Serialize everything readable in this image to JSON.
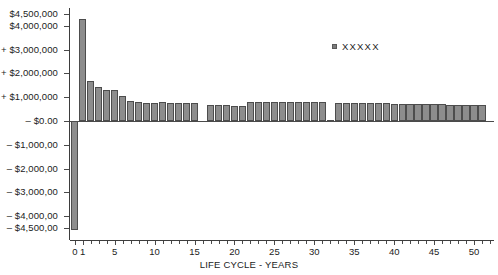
{
  "chart_data": {
    "type": "bar",
    "title": "",
    "subtitle": "",
    "xlabel": "LIFE CYCLE - YEARS",
    "ylabel": "",
    "grid": false,
    "legend_position": "inside-top-right",
    "legend": [
      {
        "label": "XXXXX",
        "color": "#8d8d8d"
      }
    ],
    "ylim": [
      -5000000,
      4750000
    ],
    "xlim": [
      -0.6,
      52.5
    ],
    "y_ticks": [
      {
        "value": 4500000,
        "label": "$4,500,000"
      },
      {
        "value": 4000000,
        "label": "$4,000,000"
      },
      {
        "value": 3000000,
        "label": "+ $3,000,000"
      },
      {
        "value": 2000000,
        "label": "+ $2,000,000"
      },
      {
        "value": 1000000,
        "label": "+ $1,000,000"
      },
      {
        "value": 0,
        "label": "– $0.00"
      },
      {
        "value": -1000000,
        "label": "– $1,000,00"
      },
      {
        "value": -2000000,
        "label": "– $2,000,00"
      },
      {
        "value": -3000000,
        "label": "– $3,000,00"
      },
      {
        "value": -4000000,
        "label": "– $4,000,00"
      },
      {
        "value": -4500000,
        "label": "– $4,500,00"
      }
    ],
    "x_ticks": [
      {
        "value": 0,
        "label": "0"
      },
      {
        "value": 1,
        "label": "1"
      },
      {
        "value": 5,
        "label": "5"
      },
      {
        "value": 10,
        "label": "10"
      },
      {
        "value": 15,
        "label": "15"
      },
      {
        "value": 20,
        "label": "20"
      },
      {
        "value": 25,
        "label": "25"
      },
      {
        "value": 30,
        "label": "30"
      },
      {
        "value": 35,
        "label": "35"
      },
      {
        "value": 40,
        "label": "40"
      },
      {
        "value": 45,
        "label": "45"
      },
      {
        "value": 50,
        "label": "50"
      }
    ],
    "categories": [
      0,
      1,
      2,
      3,
      4,
      5,
      6,
      7,
      8,
      9,
      10,
      11,
      12,
      13,
      14,
      15,
      16,
      17,
      18,
      19,
      20,
      21,
      22,
      23,
      24,
      25,
      26,
      27,
      28,
      29,
      30,
      31,
      32,
      33,
      34,
      35,
      36,
      37,
      38,
      39,
      40,
      41,
      42,
      43,
      44,
      45,
      46,
      47,
      48,
      49,
      50,
      51
    ],
    "values": [
      -4600000,
      4300000,
      1700000,
      1450000,
      1300000,
      1300000,
      1050000,
      850000,
      780000,
      770000,
      770000,
      780000,
      770000,
      760000,
      760000,
      760000,
      0,
      680000,
      660000,
      660000,
      620000,
      640000,
      820000,
      800000,
      800000,
      800000,
      790000,
      790000,
      790000,
      790000,
      790000,
      790000,
      60000,
      760000,
      760000,
      750000,
      750000,
      745000,
      740000,
      740000,
      735000,
      730000,
      720000,
      715000,
      710000,
      700000,
      695000,
      690000,
      685000,
      680000,
      675000,
      670000
    ]
  }
}
